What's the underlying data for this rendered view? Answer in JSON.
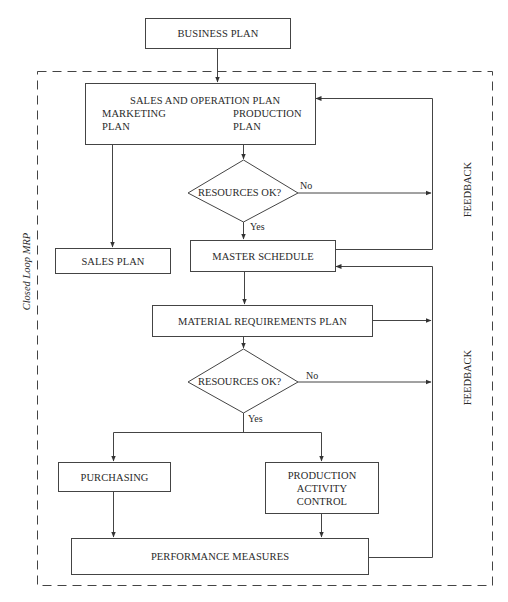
{
  "diagram": {
    "type": "flowchart",
    "boundary_label": "Closed Loop MRP",
    "nodes": {
      "business_plan": "BUSINESS PLAN",
      "sales_operation_plan": {
        "title": "SALES AND OPERATION PLAN",
        "left_line1": "MARKETING",
        "left_line2": "PLAN",
        "right_line1": "PRODUCTION",
        "right_line2": "PLAN"
      },
      "decision_1": "RESOURCES OK?",
      "sales_plan": "SALES PLAN",
      "master_schedule": "MASTER SCHEDULE",
      "material_requirements_plan": "MATERIAL REQUIREMENTS PLAN",
      "decision_2": "RESOURCES OK?",
      "purchasing": "PURCHASING",
      "production_activity_control": {
        "line1": "PRODUCTION",
        "line2": "ACTIVITY",
        "line3": "CONTROL"
      },
      "performance_measures": "PERFORMANCE MEASURES"
    },
    "edge_labels": {
      "decision_1_no": "No",
      "decision_1_yes": "Yes",
      "decision_2_no": "No",
      "decision_2_yes": "Yes"
    },
    "feedback_labels": {
      "upper": "FEEDBACK",
      "lower": "FEEDBACK"
    },
    "edges": [
      {
        "from": "BUSINESS PLAN",
        "to": "SALES AND OPERATION PLAN"
      },
      {
        "from": "MARKETING PLAN",
        "to": "PRODUCTION PLAN",
        "bidirectional": true
      },
      {
        "from": "SALES AND OPERATION PLAN",
        "to": "RESOURCES OK? (1)"
      },
      {
        "from": "SALES AND OPERATION PLAN",
        "to": "SALES PLAN"
      },
      {
        "from": "RESOURCES OK? (1)",
        "to": "FEEDBACK (upper)",
        "label": "No"
      },
      {
        "from": "RESOURCES OK? (1)",
        "to": "MASTER SCHEDULE",
        "label": "Yes"
      },
      {
        "from": "MASTER SCHEDULE",
        "to": "SALES AND OPERATION PLAN",
        "via": "FEEDBACK (upper)"
      },
      {
        "from": "MASTER SCHEDULE",
        "to": "MATERIAL REQUIREMENTS PLAN"
      },
      {
        "from": "MATERIAL REQUIREMENTS PLAN",
        "to": "FEEDBACK (lower)"
      },
      {
        "from": "MATERIAL REQUIREMENTS PLAN",
        "to": "RESOURCES OK? (2)"
      },
      {
        "from": "RESOURCES OK? (2)",
        "to": "FEEDBACK (lower)",
        "label": "No"
      },
      {
        "from": "RESOURCES OK? (2)",
        "to": "PURCHASING",
        "label": "Yes"
      },
      {
        "from": "RESOURCES OK? (2)",
        "to": "PRODUCTION ACTIVITY CONTROL",
        "label": "Yes"
      },
      {
        "from": "PURCHASING",
        "to": "PERFORMANCE MEASURES"
      },
      {
        "from": "PRODUCTION ACTIVITY CONTROL",
        "to": "PERFORMANCE MEASURES"
      },
      {
        "from": "PERFORMANCE MEASURES",
        "to": "MASTER SCHEDULE",
        "via": "FEEDBACK (lower)"
      }
    ]
  }
}
